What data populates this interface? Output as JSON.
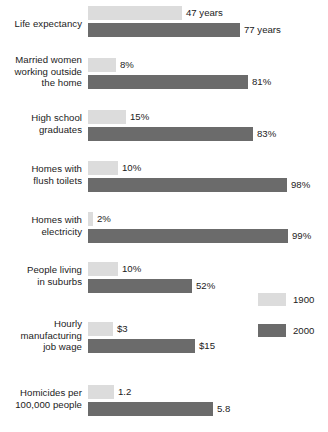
{
  "chart_data": {
    "type": "bar",
    "title": "",
    "subtitle": "",
    "xlabel": "",
    "ylabel": "",
    "orientation": "horizontal",
    "grid": false,
    "legend_position": "right-middle",
    "categories": [
      "Life expectancy",
      "Married women working outside the home",
      "High school graduates",
      "Homes with flush toilets",
      "Homes with electricity",
      "People living in suburbs",
      "Hourly manufacturing job wage",
      "Homicides per 100,000 people"
    ],
    "series": [
      {
        "name": "1900",
        "color": "#dcdcdc",
        "values": [
          47,
          8,
          15,
          10,
          2,
          10,
          3,
          1.2
        ],
        "labels": [
          "47 years",
          "8%",
          "15%",
          "10%",
          "2%",
          "10%",
          "$3",
          "1.2"
        ]
      },
      {
        "name": "2000",
        "color": "#6b6b6b",
        "values": [
          77,
          81,
          83,
          98,
          99,
          52,
          15,
          5.8
        ],
        "labels": [
          "77 years",
          "81%",
          "83%",
          "98%",
          "99%",
          "52%",
          "$15",
          "5.8"
        ]
      }
    ]
  },
  "groups": [
    {
      "label_lines": [
        "Life expectancy"
      ],
      "top": 6,
      "label_top": 18,
      "bars": [
        {
          "series": "1900",
          "width": 94,
          "value_label": "47 years"
        },
        {
          "series": "2000",
          "width": 152,
          "value_label": "77 years"
        }
      ]
    },
    {
      "label_lines": [
        "Married women",
        "working outside",
        "the home"
      ],
      "top": 58,
      "label_top": 54,
      "bars": [
        {
          "series": "1900",
          "width": 28,
          "value_label": "8%"
        },
        {
          "series": "2000",
          "width": 160,
          "value_label": "81%"
        }
      ]
    },
    {
      "label_lines": [
        "High school",
        "graduates"
      ],
      "top": 110,
      "label_top": 112,
      "bars": [
        {
          "series": "1900",
          "width": 38,
          "value_label": "15%"
        },
        {
          "series": "2000",
          "width": 165,
          "value_label": "83%"
        }
      ]
    },
    {
      "label_lines": [
        "Homes with",
        "flush toilets"
      ],
      "top": 161,
      "label_top": 163,
      "bars": [
        {
          "series": "1900",
          "width": 30,
          "value_label": "10%"
        },
        {
          "series": "2000",
          "width": 199,
          "value_label": "98%"
        }
      ]
    },
    {
      "label_lines": [
        "Homes with",
        "electricity"
      ],
      "top": 212,
      "label_top": 214,
      "bars": [
        {
          "series": "1900",
          "width": 5,
          "value_label": "2%"
        },
        {
          "series": "2000",
          "width": 200,
          "value_label": "99%"
        }
      ]
    },
    {
      "label_lines": [
        "People living",
        "in suburbs"
      ],
      "top": 262,
      "label_top": 264,
      "bars": [
        {
          "series": "1900",
          "width": 30,
          "value_label": "10%"
        },
        {
          "series": "2000",
          "width": 104,
          "value_label": "52%"
        }
      ]
    },
    {
      "label_lines": [
        "Hourly",
        "manufacturing",
        "job wage"
      ],
      "top": 322,
      "label_top": 318,
      "bars": [
        {
          "series": "1900",
          "width": 25,
          "value_label": "$3"
        },
        {
          "series": "2000",
          "width": 107,
          "value_label": "$15"
        }
      ]
    },
    {
      "label_lines": [
        "Homicides per",
        "100,000 people"
      ],
      "top": 385,
      "label_top": 387,
      "bars": [
        {
          "series": "1900",
          "width": 26,
          "value_label": "1.2"
        },
        {
          "series": "2000",
          "width": 125,
          "value_label": "5.8"
        }
      ]
    }
  ],
  "legend": {
    "items": [
      {
        "label": "1900",
        "color": "#dcdcdc"
      },
      {
        "label": "2000",
        "color": "#6b6b6b"
      }
    ]
  },
  "colors": {
    "background": "#ffffff",
    "series_1900": "#dcdcdc",
    "series_2000": "#6b6b6b",
    "text": "#1b1b1b"
  }
}
